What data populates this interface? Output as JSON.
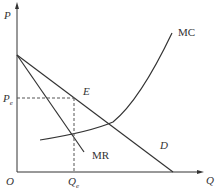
{
  "diagram": {
    "axes": {
      "y_label": "P",
      "x_label": "Q",
      "origin_label": "O"
    },
    "curves": {
      "mc": "MC",
      "mr": "MR",
      "demand": "D"
    },
    "equilibrium": {
      "point_label": "E",
      "price_label": "P",
      "price_sub": "e",
      "quantity_label": "Q",
      "quantity_sub": "e"
    }
  }
}
